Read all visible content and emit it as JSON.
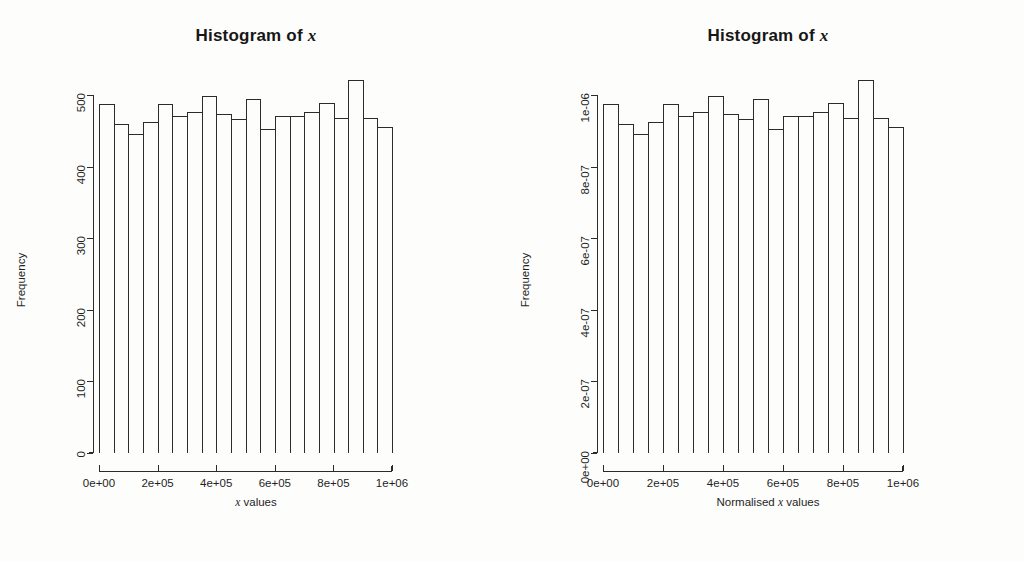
{
  "figure": {
    "background": "#fdfdfc",
    "ink": "#2b2b2b",
    "panel_count": 2
  },
  "panels": [
    {
      "id": "left",
      "title_prefix": "Histogram of ",
      "title_var": "x",
      "xlab_prefix": "",
      "xlab_var": "x",
      "xlab_suffix": " values",
      "ylab": "Frequency",
      "y_ticks": [
        "0",
        "100",
        "200",
        "300",
        "400",
        "500"
      ],
      "x_ticks": [
        "0e+00",
        "2e+05",
        "4e+05",
        "6e+05",
        "8e+05",
        "1e+06"
      ]
    },
    {
      "id": "right",
      "title_prefix": "Histogram of ",
      "title_var": "x",
      "xlab_prefix": "Normalised ",
      "xlab_var": "x",
      "xlab_suffix": " values",
      "ylab": "Frequency",
      "y_ticks": [
        "0e+00",
        "2e-07",
        "4e-07",
        "6e-07",
        "8e-07",
        "1e-06"
      ],
      "x_ticks": [
        "0e+00",
        "2e+05",
        "4e+05",
        "6e+05",
        "8e+05",
        "1e+06"
      ]
    }
  ],
  "chart_data": [
    {
      "type": "bar",
      "title": "Histogram of x",
      "xlabel": "x values",
      "ylabel": "Frequency",
      "grid": false,
      "legend": "none",
      "bins": 20,
      "bin_width": 50000,
      "bin_edges": [
        0,
        50000,
        100000,
        150000,
        200000,
        250000,
        300000,
        350000,
        400000,
        450000,
        500000,
        550000,
        600000,
        650000,
        700000,
        750000,
        800000,
        850000,
        900000,
        950000,
        1000000
      ],
      "categories": [
        "0-5e+04",
        "5e+04-1e+05",
        "1e+05-1.5e+05",
        "1.5e+05-2e+05",
        "2e+05-2.5e+05",
        "2.5e+05-3e+05",
        "3e+05-3.5e+05",
        "3.5e+05-4e+05",
        "4e+05-4.5e+05",
        "4.5e+05-5e+05",
        "5e+05-5.5e+05",
        "5.5e+05-6e+05",
        "6e+05-6.5e+05",
        "6.5e+05-7e+05",
        "7e+05-7.5e+05",
        "7.5e+05-8e+05",
        "8e+05-8.5e+05",
        "8.5e+05-9e+05",
        "9e+05-9.5e+05",
        "9.5e+05-1e+06"
      ],
      "values": [
        487,
        460,
        445,
        462,
        488,
        470,
        476,
        499,
        474,
        467,
        495,
        453,
        471,
        470,
        476,
        489,
        468,
        521,
        468,
        456,
        479
      ],
      "xlim": [
        0,
        1000000
      ],
      "ylim": [
        0,
        500
      ],
      "ytick_values": [
        0,
        100,
        200,
        300,
        400,
        500
      ],
      "xtick_values": [
        0,
        200000,
        400000,
        600000,
        800000,
        1000000
      ],
      "xtick_labels": [
        "0e+00",
        "2e+05",
        "4e+05",
        "6e+05",
        "8e+05",
        "1e+06"
      ],
      "ytick_labels": [
        "0",
        "100",
        "200",
        "300",
        "400",
        "500"
      ]
    },
    {
      "type": "bar",
      "title": "Histogram of x",
      "xlabel": "Normalised x values",
      "ylabel": "Frequency",
      "grid": false,
      "legend": "none",
      "bins": 20,
      "bin_width": 50000,
      "bin_edges": [
        0,
        50000,
        100000,
        150000,
        200000,
        250000,
        300000,
        350000,
        400000,
        450000,
        500000,
        550000,
        600000,
        650000,
        700000,
        750000,
        800000,
        850000,
        900000,
        950000,
        1000000
      ],
      "categories": [
        "0-5e+04",
        "5e+04-1e+05",
        "1e+05-1.5e+05",
        "1.5e+05-2e+05",
        "2e+05-2.5e+05",
        "2.5e+05-3e+05",
        "3e+05-3.5e+05",
        "3.5e+05-4e+05",
        "4e+05-4.5e+05",
        "4.5e+05-5e+05",
        "5e+05-5.5e+05",
        "5.5e+05-6e+05",
        "6e+05-6.5e+05",
        "6.5e+05-7e+05",
        "7e+05-7.5e+05",
        "7.5e+05-8e+05",
        "8e+05-8.5e+05",
        "8.5e+05-9e+05",
        "9e+05-9.5e+05",
        "9.5e+05-1e+06"
      ],
      "values": [
        9.74e-07,
        9.2e-07,
        8.9e-07,
        9.24e-07,
        9.76e-07,
        9.4e-07,
        9.52e-07,
        9.98e-07,
        9.48e-07,
        9.34e-07,
        9.9e-07,
        9.06e-07,
        9.42e-07,
        9.4e-07,
        9.52e-07,
        9.78e-07,
        9.36e-07,
        1.042e-06,
        9.36e-07,
        9.12e-07,
        9.58e-07
      ],
      "xlim": [
        0,
        1000000
      ],
      "ylim": [
        0,
        1e-06
      ],
      "ytick_values": [
        0,
        2e-07,
        4e-07,
        6e-07,
        8e-07,
        1e-06
      ],
      "xtick_values": [
        0,
        200000,
        400000,
        600000,
        800000,
        1000000
      ],
      "xtick_labels": [
        "0e+00",
        "2e+05",
        "4e+05",
        "6e+05",
        "8e+05",
        "1e+06"
      ],
      "ytick_labels": [
        "0e+00",
        "2e-07",
        "4e-07",
        "6e-07",
        "8e-07",
        "1e-06"
      ]
    }
  ]
}
